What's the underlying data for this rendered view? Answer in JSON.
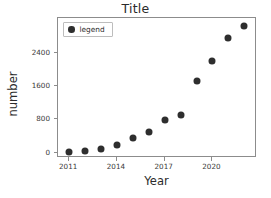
{
  "chart_data": {
    "type": "scatter",
    "title": "Title",
    "xlabel": "Year",
    "ylabel": "number",
    "x": [
      2011,
      2012,
      2013,
      2014,
      2015,
      2016,
      2017,
      2018,
      2019,
      2020,
      2021,
      2022
    ],
    "values": [
      10,
      40,
      90,
      190,
      340,
      500,
      780,
      900,
      1720,
      2200,
      2750,
      3050
    ],
    "series": [
      {
        "name": "legend",
        "values": [
          10,
          40,
          90,
          190,
          340,
          500,
          780,
          900,
          1720,
          2200,
          2750,
          3050
        ]
      }
    ],
    "xlim": [
      2010.3,
      2022.8
    ],
    "ylim": [
      -130,
      3230
    ],
    "xticks": [
      2011,
      2014,
      2017,
      2020
    ],
    "xticklabels": [
      "2011",
      "2014",
      "2017",
      "2020"
    ],
    "yticks": [
      0,
      800,
      1600,
      2400
    ],
    "yticklabels": [
      "0",
      "800",
      "1600",
      "2400"
    ],
    "grid": false,
    "legend": {
      "entries": [
        "legend"
      ],
      "position": "upper-left",
      "marker": "filled-circle"
    },
    "marker_color": "#2e2e2e"
  }
}
